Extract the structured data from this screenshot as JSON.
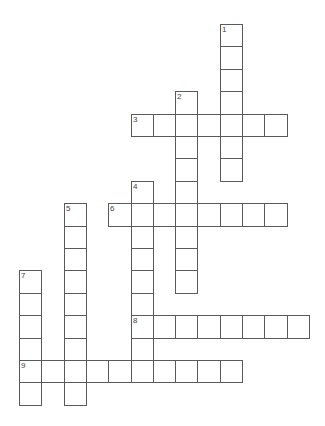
{
  "puzzle": {
    "type": "crossword",
    "grid": {
      "origin_x": 19,
      "origin_y": 24,
      "cell_w": 22.3,
      "cell_h": 22.4,
      "line_color": "#5a5a5a",
      "background": "#ffffff"
    },
    "entries": [
      {
        "number": "1",
        "direction": "down",
        "row": 0,
        "col": 9,
        "length": 7
      },
      {
        "number": "2",
        "direction": "down",
        "row": 3,
        "col": 7,
        "length": 9
      },
      {
        "number": "3",
        "direction": "across",
        "row": 4,
        "col": 5,
        "length": 7
      },
      {
        "number": "4",
        "direction": "down",
        "row": 7,
        "col": 5,
        "length": 9
      },
      {
        "number": "5",
        "direction": "down",
        "row": 8,
        "col": 2,
        "length": 9
      },
      {
        "number": "6",
        "direction": "across",
        "row": 8,
        "col": 4,
        "length": 8
      },
      {
        "number": "7",
        "direction": "down",
        "row": 11,
        "col": 0,
        "length": 6
      },
      {
        "number": "8",
        "direction": "across",
        "row": 13,
        "col": 5,
        "length": 8
      },
      {
        "number": "9",
        "direction": "across",
        "row": 15,
        "col": 0,
        "length": 10
      }
    ]
  }
}
